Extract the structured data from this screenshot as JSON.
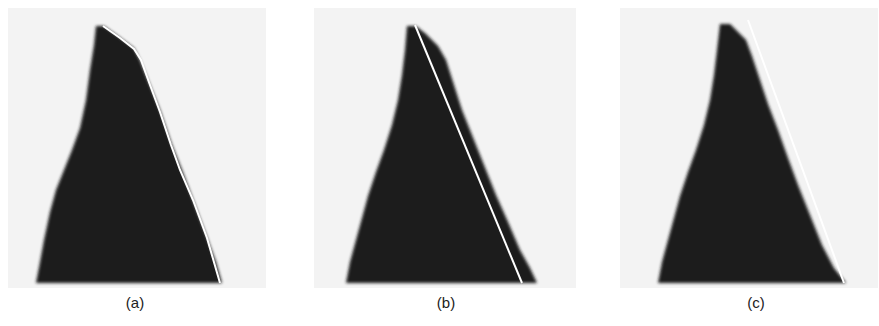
{
  "figure": {
    "background_color": "#f4f4f4",
    "shape_color": "#1c1c1c",
    "line_color": "#ffffff",
    "panels": [
      {
        "label": "(a)",
        "description": "Pixelated dark wedge with polyline boundary fit (piecewise segments) along right edge",
        "label_x": 135
      },
      {
        "label": "(b)",
        "description": "Pixelated dark wedge with single straight line fit along right edge, inside the shape",
        "label_x": 446
      },
      {
        "label": "(c)",
        "description": "Pixelated dark wedge with single straight line fit along outer right edge",
        "label_x": 756
      }
    ]
  }
}
